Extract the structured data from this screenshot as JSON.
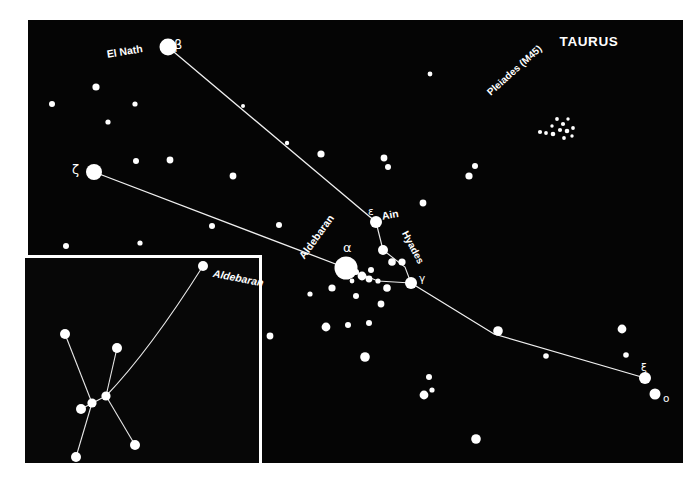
{
  "figure": {
    "title": "TAURUS",
    "kind": "star-chart",
    "background_color": "#ffffff",
    "sky_color": "#050505",
    "star_color": "#ffffff",
    "line_color": "#f0f0f0"
  },
  "main_panel": {
    "x": 28,
    "y": 20,
    "width": 655,
    "height": 443,
    "title_label": "TAURUS"
  },
  "labels": {
    "el_nath": "El Nath",
    "beta": "β",
    "zeta": "ζ",
    "aldebaran": "Aldebaran",
    "alpha": "α",
    "epsilon": "ε",
    "ain": "Ain",
    "hyades": "Hyades",
    "gamma": "γ",
    "pleiades": "Pleiades (M45)",
    "xi": "ξ",
    "omicron": "ο"
  },
  "inset": {
    "x": 22,
    "y": 255,
    "width": 240,
    "height": 211,
    "aldebaran_label": "Aldebaran"
  },
  "chart_data": {
    "type": "scatter",
    "title": "TAURUS",
    "xlabel": "",
    "ylabel": "",
    "xlim": [
      28,
      683
    ],
    "ylim": [
      20,
      463
    ],
    "grid": false,
    "legend": "none",
    "note": "Constellation map of Taurus with named stars, Hyades and Pleiades clusters, plus an inset detail panel.",
    "named_stars": [
      {
        "name": "El Nath",
        "designation": "β",
        "x": 168,
        "y": 47,
        "r": 8.5,
        "label_side": "left"
      },
      {
        "name": "",
        "designation": "ζ",
        "x": 94,
        "y": 172,
        "r": 8.0,
        "label_side": "left"
      },
      {
        "name": "Aldebaran",
        "designation": "α",
        "x": 346,
        "y": 268,
        "r": 11.5,
        "label_side": "upleft"
      },
      {
        "name": "Ain",
        "designation": "ε",
        "x": 376,
        "y": 222,
        "r": 6.0,
        "label_side": "upright"
      },
      {
        "name": "",
        "designation": "γ",
        "x": 411,
        "y": 283,
        "r": 6.0,
        "label_side": "right"
      },
      {
        "name": "",
        "designation": "ξ",
        "x": 645,
        "y": 378,
        "r": 6.0,
        "label_side": "upright"
      },
      {
        "name": "",
        "designation": "ο",
        "x": 655,
        "y": 394,
        "r": 5.5,
        "label_side": "right"
      }
    ],
    "cluster_labels": [
      {
        "name": "Pleiades (M45)",
        "x": 522,
        "y": 112,
        "rotation": -42
      },
      {
        "name": "Hyades",
        "x": 422,
        "y": 250,
        "rotation": 62
      }
    ],
    "constellation_lines": [
      {
        "from": "β",
        "to": "ε",
        "points": [
          [
            168,
            47
          ],
          [
            376,
            222
          ]
        ]
      },
      {
        "from": "ζ",
        "to": "α",
        "points": [
          [
            94,
            172
          ],
          [
            346,
            268
          ]
        ]
      },
      {
        "from": "ε",
        "to": "hyades-mid",
        "points": [
          [
            376,
            222
          ],
          [
            383,
            250
          ]
        ]
      },
      {
        "from": "hyades-mid",
        "to": "γ",
        "points": [
          [
            383,
            250
          ],
          [
            405,
            267
          ],
          [
            411,
            283
          ]
        ]
      },
      {
        "from": "α",
        "to": "γ",
        "points": [
          [
            346,
            268
          ],
          [
            378,
            281
          ],
          [
            411,
            283
          ]
        ]
      },
      {
        "from": "γ",
        "to": "ξ",
        "points": [
          [
            411,
            283
          ],
          [
            494,
            334
          ],
          [
            645,
            378
          ]
        ]
      }
    ],
    "field_stars": [
      {
        "x": 52,
        "y": 104,
        "r": 3.0
      },
      {
        "x": 96,
        "y": 87,
        "r": 3.6
      },
      {
        "x": 135,
        "y": 104,
        "r": 2.6
      },
      {
        "x": 108,
        "y": 122,
        "r": 2.6
      },
      {
        "x": 136,
        "y": 161,
        "r": 3.0
      },
      {
        "x": 170,
        "y": 160,
        "r": 3.4
      },
      {
        "x": 233,
        "y": 176,
        "r": 3.4
      },
      {
        "x": 321,
        "y": 154,
        "r": 3.6
      },
      {
        "x": 66,
        "y": 246,
        "r": 3.0
      },
      {
        "x": 212,
        "y": 226,
        "r": 3.0
      },
      {
        "x": 140,
        "y": 243,
        "r": 2.6
      },
      {
        "x": 279,
        "y": 225,
        "r": 3.0
      },
      {
        "x": 469,
        "y": 176,
        "r": 3.6
      },
      {
        "x": 475,
        "y": 166,
        "r": 3.0
      },
      {
        "x": 384,
        "y": 158,
        "r": 3.4
      },
      {
        "x": 388,
        "y": 167,
        "r": 3.0
      },
      {
        "x": 423,
        "y": 203,
        "r": 3.4
      },
      {
        "x": 430,
        "y": 74,
        "r": 2.4
      },
      {
        "x": 383,
        "y": 250,
        "r": 5.0
      },
      {
        "x": 392,
        "y": 262,
        "r": 3.8
      },
      {
        "x": 402,
        "y": 262,
        "r": 3.6
      },
      {
        "x": 332,
        "y": 288,
        "r": 3.6
      },
      {
        "x": 356,
        "y": 272,
        "r": 3.0
      },
      {
        "x": 362,
        "y": 276,
        "r": 4.4
      },
      {
        "x": 371,
        "y": 270,
        "r": 3.0
      },
      {
        "x": 369,
        "y": 279,
        "r": 3.4
      },
      {
        "x": 378,
        "y": 281,
        "r": 2.6
      },
      {
        "x": 352,
        "y": 281,
        "r": 2.4
      },
      {
        "x": 387,
        "y": 288,
        "r": 3.8
      },
      {
        "x": 356,
        "y": 296,
        "r": 3.0
      },
      {
        "x": 381,
        "y": 304,
        "r": 3.4
      },
      {
        "x": 310,
        "y": 294,
        "r": 2.6
      },
      {
        "x": 348,
        "y": 325,
        "r": 3.0
      },
      {
        "x": 326,
        "y": 327,
        "r": 4.4
      },
      {
        "x": 369,
        "y": 323,
        "r": 3.0
      },
      {
        "x": 365,
        "y": 357,
        "r": 4.8
      },
      {
        "x": 270,
        "y": 336,
        "r": 3.4
      },
      {
        "x": 429,
        "y": 377,
        "r": 3.0
      },
      {
        "x": 432,
        "y": 390,
        "r": 2.6
      },
      {
        "x": 424,
        "y": 395,
        "r": 4.4
      },
      {
        "x": 476,
        "y": 439,
        "r": 4.8
      },
      {
        "x": 498,
        "y": 331,
        "r": 4.8
      },
      {
        "x": 546,
        "y": 356,
        "r": 2.8
      },
      {
        "x": 622,
        "y": 329,
        "r": 4.4
      },
      {
        "x": 626,
        "y": 355,
        "r": 2.8
      },
      {
        "x": 287,
        "y": 143,
        "r": 2.2
      },
      {
        "x": 243,
        "y": 106,
        "r": 2.0
      }
    ],
    "pleiades_stars": [
      {
        "x": 557,
        "y": 119,
        "r": 1.9
      },
      {
        "x": 563,
        "y": 124,
        "r": 2.1
      },
      {
        "x": 568,
        "y": 119,
        "r": 1.7
      },
      {
        "x": 560,
        "y": 130,
        "r": 2.1
      },
      {
        "x": 567,
        "y": 131,
        "r": 2.3
      },
      {
        "x": 573,
        "y": 128,
        "r": 1.9
      },
      {
        "x": 553,
        "y": 134,
        "r": 2.3
      },
      {
        "x": 546,
        "y": 133,
        "r": 1.9
      },
      {
        "x": 540,
        "y": 132,
        "r": 2.1
      },
      {
        "x": 572,
        "y": 136,
        "r": 1.7
      },
      {
        "x": 564,
        "y": 138,
        "r": 1.9
      },
      {
        "x": 552,
        "y": 126,
        "r": 1.7
      }
    ],
    "inset_stars": [
      {
        "id": "aldebaran",
        "x": 203,
        "y": 266,
        "r": 5.0
      },
      {
        "id": "s1",
        "x": 65,
        "y": 334,
        "r": 5.0
      },
      {
        "id": "s2",
        "x": 117,
        "y": 348,
        "r": 5.0
      },
      {
        "id": "s3",
        "x": 106,
        "y": 396,
        "r": 4.6
      },
      {
        "id": "s4",
        "x": 92,
        "y": 403,
        "r": 4.6
      },
      {
        "id": "s5",
        "x": 81,
        "y": 409,
        "r": 5.0
      },
      {
        "id": "s6",
        "x": 135,
        "y": 445,
        "r": 5.0
      },
      {
        "id": "s7",
        "x": 76,
        "y": 457,
        "r": 5.0
      }
    ],
    "inset_lines": [
      {
        "points": [
          [
            65,
            334
          ],
          [
            92,
            403
          ]
        ]
      },
      {
        "points": [
          [
            92,
            403
          ],
          [
            76,
            457
          ]
        ]
      },
      {
        "points": [
          [
            117,
            348
          ],
          [
            106,
            396
          ]
        ]
      },
      {
        "points": [
          [
            106,
            396
          ],
          [
            135,
            445
          ]
        ]
      },
      {
        "points": [
          [
            81,
            409
          ],
          [
            106,
            396
          ]
        ]
      },
      {
        "curve": [
          [
            106,
            396
          ],
          [
            150,
            350
          ],
          [
            203,
            266
          ]
        ]
      }
    ]
  }
}
